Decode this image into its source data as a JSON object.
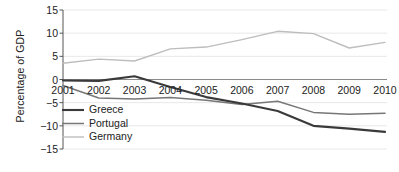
{
  "chart_data": {
    "type": "line",
    "title": "",
    "xlabel": "",
    "ylabel": "Percentage of GDP",
    "x": [
      2001,
      2002,
      2003,
      2004,
      2005,
      2006,
      2007,
      2008,
      2009,
      2010
    ],
    "xtick_labels": [
      "2001",
      "2002",
      "2003",
      "2004",
      "2005",
      "2006",
      "2007",
      "2008",
      "2009",
      "2010"
    ],
    "ytick_labels": [
      "15",
      "10",
      "5",
      "0",
      "−5",
      "−10",
      "−15"
    ],
    "ytick_values": [
      15,
      10,
      5,
      0,
      -5,
      -10,
      -15
    ],
    "ylim": [
      -15,
      15
    ],
    "xlim": [
      2001,
      2010
    ],
    "grid": true,
    "legend_position": "lower-left-inside",
    "series": [
      {
        "name": "Greece",
        "color": "#3a3a3a",
        "width": 2.1,
        "values": [
          -0.2,
          -0.3,
          0.7,
          -1.6,
          -3.8,
          -5.2,
          -6.8,
          -10.0,
          -10.6,
          -11.3
        ]
      },
      {
        "name": "Portugal",
        "color": "#777777",
        "width": 1.5,
        "values": [
          -1.3,
          -4.0,
          -4.2,
          -3.9,
          -4.5,
          -5.4,
          -4.7,
          -7.1,
          -7.5,
          -7.3
        ]
      },
      {
        "name": "Germany",
        "color": "#bdbdbd",
        "width": 1.4,
        "values": [
          3.5,
          4.4,
          4.0,
          6.6,
          7.0,
          8.6,
          10.4,
          9.9,
          6.8,
          8.0
        ]
      }
    ]
  },
  "axes": {
    "axis_color": "#555555",
    "grid_color": "#e8e8e8",
    "zero_line_color": "#8a8a8a"
  }
}
